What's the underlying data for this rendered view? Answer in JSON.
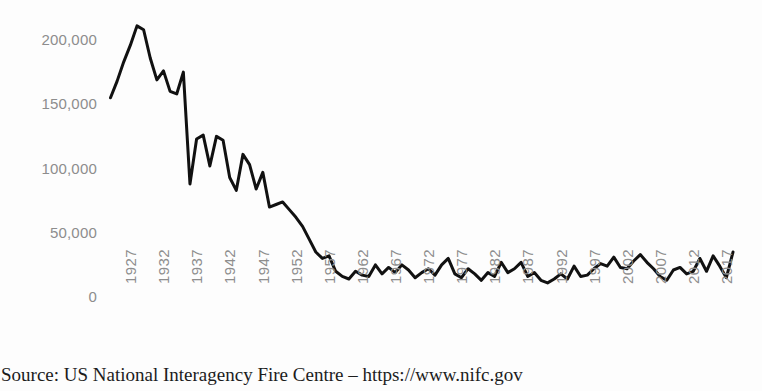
{
  "chart_data": {
    "type": "line",
    "title": "",
    "subtitle": "",
    "xlabel": "",
    "ylabel": "",
    "xlim": [
      1926,
      2020
    ],
    "ylim": [
      0,
      225000
    ],
    "grid": false,
    "legend": null,
    "legend_position": "none",
    "line_color": "#111111",
    "x_tick_labels": [
      "1927",
      "1932",
      "1937",
      "1942",
      "1947",
      "1952",
      "1957",
      "1962",
      "1967",
      "1972",
      "1977",
      "1982",
      "1987",
      "1992",
      "1997",
      "2002",
      "2007",
      "2012",
      "2017"
    ],
    "y_tick_labels": [
      "200,000",
      "150,000",
      "100,000",
      "50,000",
      "0"
    ],
    "y_tick_values": [
      200000,
      150000,
      100000,
      50000,
      0
    ],
    "series": [
      {
        "name": "US acres burned by wildfire",
        "x": [
          1926,
          1927,
          1928,
          1929,
          1930,
          1931,
          1932,
          1933,
          1934,
          1935,
          1936,
          1937,
          1938,
          1939,
          1940,
          1941,
          1942,
          1943,
          1944,
          1945,
          1946,
          1947,
          1948,
          1949,
          1950,
          1951,
          1952,
          1953,
          1954,
          1955,
          1956,
          1957,
          1958,
          1959,
          1960,
          1961,
          1962,
          1963,
          1964,
          1965,
          1966,
          1967,
          1968,
          1969,
          1970,
          1971,
          1972,
          1973,
          1974,
          1975,
          1976,
          1977,
          1978,
          1979,
          1980,
          1981,
          1982,
          1983,
          1984,
          1985,
          1986,
          1987,
          1988,
          1989,
          1990,
          1991,
          1992,
          1993,
          1994,
          1995,
          1996,
          1997,
          1998,
          1999,
          2000,
          2001,
          2002,
          2003,
          2004,
          2005,
          2006,
          2007,
          2008,
          2009,
          2010,
          2011,
          2012,
          2013,
          2014,
          2015,
          2016,
          2017,
          2018,
          2019,
          2020
        ],
        "values": [
          155000,
          168000,
          183000,
          196000,
          211000,
          208000,
          186000,
          169000,
          176000,
          160000,
          158000,
          175000,
          88000,
          123000,
          126000,
          102000,
          125000,
          122000,
          93000,
          83000,
          111000,
          103000,
          84000,
          97000,
          70000,
          72000,
          74000,
          68000,
          62000,
          55000,
          45000,
          35000,
          30000,
          32000,
          20000,
          16000,
          14000,
          20000,
          17000,
          16000,
          25000,
          18000,
          23000,
          19000,
          25000,
          21000,
          15000,
          19000,
          22000,
          17000,
          25000,
          30000,
          18000,
          15000,
          22000,
          18000,
          13000,
          19000,
          16000,
          27000,
          19000,
          22000,
          27000,
          16000,
          19000,
          13000,
          11000,
          14000,
          18000,
          14000,
          24000,
          16000,
          17000,
          22000,
          26000,
          24000,
          31000,
          23000,
          22000,
          28000,
          33000,
          27000,
          22000,
          16000,
          13000,
          21000,
          23000,
          18000,
          20000,
          30000,
          20000,
          32000,
          24000,
          15000,
          35000
        ]
      }
    ]
  },
  "caption": {
    "text": "Source: US National Interagency Fire Centre – https://www.nifc.gov"
  },
  "colors": {
    "background": "#fdfdfd",
    "tick_label": "#8d8d8d",
    "line": "#111111",
    "caption": "#1c1c1c"
  }
}
